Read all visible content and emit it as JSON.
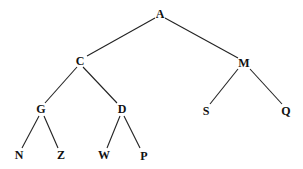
{
  "diagram": {
    "type": "binary-tree",
    "root": "A",
    "nodes": [
      {
        "id": "A",
        "label": "A",
        "x": 160,
        "y": 14
      },
      {
        "id": "C",
        "label": "C",
        "x": 80,
        "y": 61
      },
      {
        "id": "M",
        "label": "M",
        "x": 244,
        "y": 63
      },
      {
        "id": "G",
        "label": "G",
        "x": 41,
        "y": 109
      },
      {
        "id": "D",
        "label": "D",
        "x": 122,
        "y": 109
      },
      {
        "id": "S",
        "label": "S",
        "x": 206,
        "y": 111
      },
      {
        "id": "Q",
        "label": "Q",
        "x": 286,
        "y": 111
      },
      {
        "id": "N",
        "label": "N",
        "x": 19,
        "y": 155
      },
      {
        "id": "Z",
        "label": "Z",
        "x": 61,
        "y": 155
      },
      {
        "id": "W",
        "label": "W",
        "x": 104,
        "y": 155
      },
      {
        "id": "P",
        "label": "P",
        "x": 144,
        "y": 156
      }
    ],
    "edges": [
      {
        "from": "A",
        "to": "C",
        "x1": 155,
        "y1": 18,
        "x2": 87,
        "y2": 56
      },
      {
        "from": "A",
        "to": "M",
        "x1": 165,
        "y1": 18,
        "x2": 238,
        "y2": 58
      },
      {
        "from": "C",
        "to": "G",
        "x1": 77,
        "y1": 67,
        "x2": 45,
        "y2": 103
      },
      {
        "from": "C",
        "to": "D",
        "x1": 83,
        "y1": 67,
        "x2": 117,
        "y2": 103
      },
      {
        "from": "M",
        "to": "S",
        "x1": 238,
        "y1": 69,
        "x2": 210,
        "y2": 104
      },
      {
        "from": "M",
        "to": "Q",
        "x1": 250,
        "y1": 69,
        "x2": 282,
        "y2": 104
      },
      {
        "from": "G",
        "to": "N",
        "x1": 39,
        "y1": 116,
        "x2": 22,
        "y2": 148
      },
      {
        "from": "G",
        "to": "Z",
        "x1": 44,
        "y1": 116,
        "x2": 58,
        "y2": 148
      },
      {
        "from": "D",
        "to": "W",
        "x1": 120,
        "y1": 116,
        "x2": 107,
        "y2": 148
      },
      {
        "from": "D",
        "to": "P",
        "x1": 124,
        "y1": 116,
        "x2": 140,
        "y2": 148
      }
    ]
  }
}
